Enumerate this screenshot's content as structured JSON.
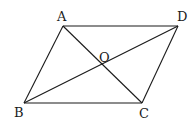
{
  "figure": {
    "type": "parallelogram-with-diagonals",
    "colors": {
      "stroke": "#1a1a1a",
      "background": "#ffffff"
    },
    "vertices": {
      "A": {
        "label": "A",
        "x": 63,
        "y": 26
      },
      "D": {
        "label": "D",
        "x": 178,
        "y": 26
      },
      "B": {
        "label": "B",
        "x": 24,
        "y": 103
      },
      "C": {
        "label": "C",
        "x": 142,
        "y": 103
      },
      "O": {
        "label": "O",
        "x": 104,
        "y": 66
      }
    },
    "segments": [
      "AD",
      "AB",
      "BC",
      "CD",
      "AC",
      "BD"
    ]
  }
}
